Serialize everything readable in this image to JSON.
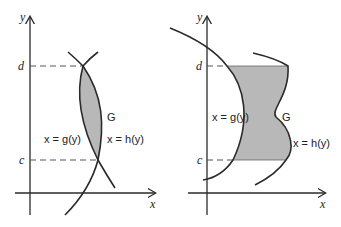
{
  "diagrams": [
    {
      "id": "left",
      "axis_labels": {
        "x": "x",
        "y": "y"
      },
      "bound_labels": {
        "upper": "d",
        "lower": "c"
      },
      "region_label": "G",
      "left_curve_label": "x = g(y)",
      "right_curve_label": "x = h(y)",
      "description": "Lens-shaped shaded region G between two crossing curves x = g(y) and x = h(y), intersecting at y = c and y = d"
    },
    {
      "id": "right",
      "axis_labels": {
        "x": "x",
        "y": "y"
      },
      "bound_labels": {
        "upper": "d",
        "lower": "c"
      },
      "region_label": "G",
      "left_curve_label": "x = g(y)",
      "right_curve_label": "x = h(y)",
      "description": "Shaded region G bounded on the left by x = g(y), on the right by x = h(y), and horizontally by y = c and y = d"
    }
  ],
  "colors": {
    "region_fill": "#b8b8b8",
    "curve_stroke": "#2a2a2a",
    "background": "#ffffff"
  }
}
